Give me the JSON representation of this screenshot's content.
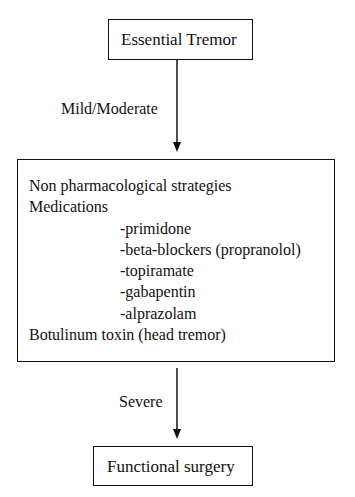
{
  "diagram": {
    "type": "flowchart",
    "nodes": {
      "top": {
        "label": "Essential Tremor"
      },
      "middle": {
        "lines": [
          {
            "text": "Non pharmacological strategies",
            "indent": 0
          },
          {
            "text": "Medications",
            "indent": 0
          },
          {
            "text": "-primidone",
            "indent": 1
          },
          {
            "text": "-beta-blockers (propranolol)",
            "indent": 1
          },
          {
            "text": "-topiramate",
            "indent": 1
          },
          {
            "text": "-gabapentin",
            "indent": 1
          },
          {
            "text": "-alprazolam",
            "indent": 1
          },
          {
            "text": "Botulinum toxin (head tremor)",
            "indent": 0
          }
        ]
      },
      "bottom": {
        "label": "Functional surgery"
      }
    },
    "edges": [
      {
        "from": "top",
        "to": "middle",
        "label": "Mild/Moderate"
      },
      {
        "from": "middle",
        "to": "bottom",
        "label": "Severe"
      }
    ],
    "colors": {
      "stroke": "#111111",
      "background": "#ffffff",
      "text": "#111111"
    }
  }
}
